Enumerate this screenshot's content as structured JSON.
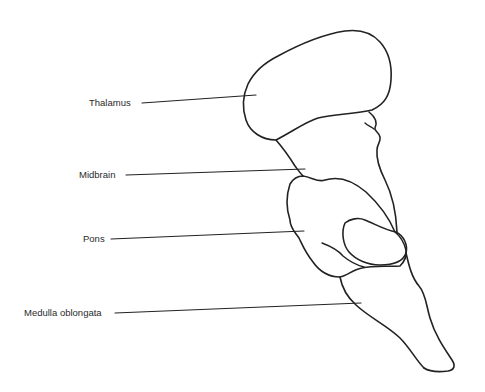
{
  "diagram": {
    "stroke_color": "#222222",
    "background": "#ffffff",
    "labels": [
      {
        "id": "thalamus",
        "text": "Thalamus"
      },
      {
        "id": "midbrain",
        "text": "Midbrain"
      },
      {
        "id": "pons",
        "text": "Pons"
      },
      {
        "id": "medulla",
        "text": "Medulla oblongata"
      }
    ]
  }
}
